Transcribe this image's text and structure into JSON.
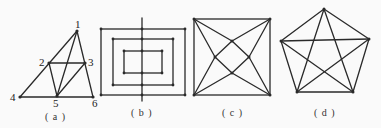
{
  "figures": [
    {
      "id": "a",
      "caption": "( a )",
      "vertex_labels": [
        "1",
        "2",
        "3",
        "4",
        "5",
        "6"
      ],
      "vertices": {
        "1": [
          77,
          31
        ],
        "2": [
          49,
          63
        ],
        "3": [
          85,
          63
        ],
        "4": [
          20,
          97
        ],
        "5": [
          57,
          96
        ],
        "6": [
          93,
          97
        ]
      },
      "edges": [
        [
          "1",
          "4"
        ],
        [
          "1",
          "6"
        ],
        [
          "1",
          "5"
        ],
        [
          "2",
          "3"
        ],
        [
          "2",
          "5"
        ],
        [
          "3",
          "5"
        ],
        [
          "4",
          "6"
        ]
      ]
    },
    {
      "id": "b",
      "caption": "( b )",
      "rects": [
        {
          "x": 101,
          "y": 29,
          "w": 84,
          "h": 66
        },
        {
          "x": 113,
          "y": 39,
          "w": 60,
          "h": 46
        },
        {
          "x": 124,
          "y": 51,
          "w": 38,
          "h": 22
        }
      ],
      "axis": {
        "x": 142,
        "y1": 18,
        "y2": 101
      }
    },
    {
      "id": "c",
      "caption": "( c )",
      "square": {
        "x": 194,
        "y": 19,
        "w": 76,
        "h": 76
      },
      "inner": {
        "top": [
          232,
          41
        ],
        "left": [
          215,
          57
        ],
        "right": [
          249,
          57
        ],
        "bottom": [
          232,
          73
        ]
      }
    },
    {
      "id": "d",
      "caption": "( d )",
      "pentagon": {
        "top": [
          324,
          9
        ],
        "left": [
          281,
          41
        ],
        "right": [
          369,
          39
        ],
        "bl": [
          297,
          92
        ],
        "br": [
          353,
          92
        ]
      }
    }
  ]
}
